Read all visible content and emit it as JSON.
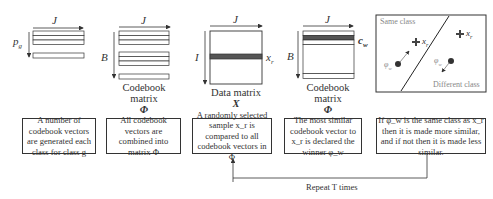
{
  "panels": [
    {
      "id": "codebook-vectors",
      "axis_labels": {
        "horizontal": "J",
        "vertical": "p_g"
      },
      "caption": "",
      "caption_symbol": ""
    },
    {
      "id": "codebook-matrix",
      "axis_labels": {
        "horizontal": "J",
        "vertical": "B"
      },
      "caption": "Codebook matrix",
      "caption_symbol": "Φ"
    },
    {
      "id": "data-matrix",
      "axis_labels": {
        "horizontal": "J",
        "vertical": "I",
        "row": "x_r"
      },
      "caption": "Data matrix",
      "caption_symbol": "X"
    },
    {
      "id": "codebook-matrix-winner",
      "axis_labels": {
        "horizontal": "J",
        "vertical": "B",
        "row": "c_w"
      },
      "caption": "Codebook matrix",
      "caption_symbol": "Φ"
    },
    {
      "id": "class-space",
      "labels": {
        "same_class": "Same class",
        "different_class": "Different class",
        "x_same": "x_r",
        "x_diff": "x_r",
        "phi_same": "φ_w",
        "phi_diff": "φ_w"
      }
    }
  ],
  "steps": [
    {
      "text": "A number of codebook vectors are generated each class for class g"
    },
    {
      "text": "All codebook vectors are combined into matrix Φ"
    },
    {
      "text": "A randomly selected sample x_r is compared to all codebook vectors in Φ"
    },
    {
      "text": "The most similar codebook vector to x_r is declared the winner φ_w"
    },
    {
      "text": "If φ_w is the same class as x_r then it is made more similar, and if not then it is made less similar."
    }
  ],
  "loop": {
    "label": "Repeat T times"
  },
  "colors": {
    "stroke": "#333333",
    "highlight_row": "#555555",
    "light_text": "#888888"
  }
}
